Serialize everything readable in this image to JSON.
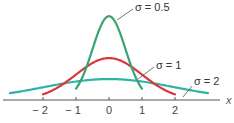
{
  "chart_data": {
    "type": "line",
    "title": "",
    "xlabel": "x",
    "ylabel": "",
    "xlim": [
      -3.2,
      3.2
    ],
    "ylim": [
      0,
      0.82
    ],
    "grid": false,
    "legend": "inline annotations",
    "x_ticks": [
      "-2",
      "-1",
      "0",
      "1",
      "2"
    ],
    "x_tick_values": [
      -2,
      -1,
      0,
      1,
      2
    ],
    "series": [
      {
        "name": "σ = 0.5",
        "label": "σ = 0.5",
        "sigma": 0.5,
        "mean": 0,
        "peak": 0.798,
        "color": "#3aa46e",
        "x_range": [
          -1,
          1
        ]
      },
      {
        "name": "σ = 1",
        "label": "σ = 1",
        "sigma": 1,
        "mean": 0,
        "peak": 0.399,
        "color": "#d9363e",
        "x_range": [
          -2,
          2
        ]
      },
      {
        "name": "σ = 2",
        "label": "σ = 2",
        "sigma": 2,
        "mean": 0,
        "peak": 0.199,
        "color": "#2fb3a6",
        "x_range": [
          -3,
          3
        ]
      }
    ]
  },
  "layout": {
    "origin_x": 109,
    "baseline_y": 100,
    "px_per_unit_x": 33,
    "px_per_unit_y": 105,
    "axis_x_start": 3,
    "axis_x_end": 220,
    "axis_color": "#555555"
  }
}
